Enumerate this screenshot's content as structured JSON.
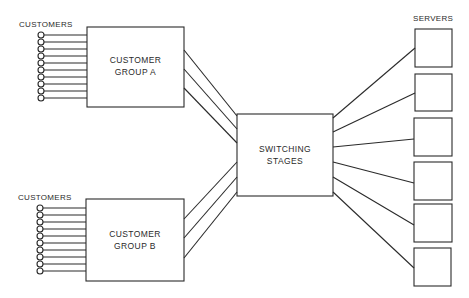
{
  "diagram": {
    "labels": {
      "customers_top": "CUSTOMERS",
      "customers_bottom": "CUSTOMERS",
      "servers": "SERVERS"
    },
    "groups": [
      {
        "id": "A",
        "line1": "CUSTOMER",
        "line2": "GROUP A",
        "customers": 10,
        "trunks": 3
      },
      {
        "id": "B",
        "line1": "CUSTOMER",
        "line2": "GROUP B",
        "customers": 10,
        "trunks": 3
      }
    ],
    "switch": {
      "line1": "SWITCHING",
      "line2": "STAGES"
    },
    "servers": {
      "count": 6
    },
    "colors": {
      "stroke": "#2a2a2a",
      "background": "#ffffff"
    }
  }
}
